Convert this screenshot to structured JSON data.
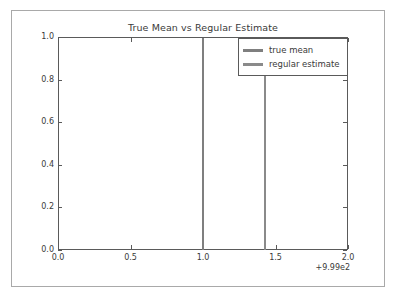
{
  "chart_data": {
    "type": "line",
    "title": "True Mean vs Regular Estimate",
    "xlabel": "",
    "ylabel": "",
    "xlim": [
      999.0,
      1001.0
    ],
    "ylim": [
      0.0,
      1.0
    ],
    "x_offset_text": "+9.99e2",
    "grid": false,
    "legend_position": "upper right",
    "x_tick_labels": [
      "0.0",
      "0.5",
      "1.0",
      "1.5",
      "2.0"
    ],
    "x_tick_values": [
      0.0,
      0.5,
      1.0,
      1.5,
      2.0
    ],
    "y_tick_labels": [
      "0.0",
      "0.2",
      "0.4",
      "0.6",
      "0.8",
      "1.0"
    ],
    "y_tick_values": [
      0.0,
      0.2,
      0.4,
      0.6,
      0.8,
      1.0
    ],
    "series": [
      {
        "name": "true mean",
        "type": "vertical-line",
        "x": 1.0,
        "y_range": [
          0.0,
          1.0
        ],
        "color": "#7f7f7f"
      },
      {
        "name": "regular estimate",
        "type": "vertical-line",
        "x": 1.43,
        "y_range": [
          0.0,
          1.0
        ],
        "color": "#8a8a8a"
      }
    ]
  },
  "legend": {
    "items": [
      {
        "label": "true mean",
        "color": "#7f7f7f"
      },
      {
        "label": "regular estimate",
        "color": "#8a8a8a"
      }
    ]
  }
}
